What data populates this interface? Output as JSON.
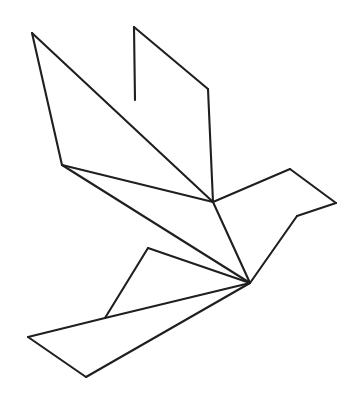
{
  "artwork": {
    "title": "Origami Dove Line Drawing",
    "subject": "origami-style geometric bird in flight",
    "style": "black outline line art on white background",
    "canvas": {
      "width": 363,
      "height": 415
    },
    "background_color": "#ffffff",
    "stroke_color": "#1f1f1f",
    "stroke_width": 2.1,
    "fill": "none",
    "text_content": "",
    "labels": [],
    "vertices": {
      "upper_wing_tip_left": [
        32,
        33
      ],
      "upper_wing_spike_tip": [
        134,
        27
      ],
      "upper_wing_spike_base": [
        135,
        100
      ],
      "upper_wing_right_corner": [
        208,
        89
      ],
      "upper_wing_right_lower": [
        213,
        202
      ],
      "left_shoulder": [
        62,
        165
      ],
      "body_center_junction": [
        213,
        202
      ],
      "head_top": [
        290,
        169
      ],
      "beak_tip": [
        336,
        203
      ],
      "beak_notch": [
        297,
        216
      ],
      "tail_convergence": [
        250,
        283
      ],
      "leg_knee": [
        148,
        248
      ],
      "tail_upper_junction": [
        105,
        318
      ],
      "tail_left_tip": [
        28,
        337
      ],
      "tail_bottom_tip": [
        86,
        377
      ]
    },
    "segments": [
      {
        "name": "left-wing-leading-edge",
        "points": "32,33 213,202"
      },
      {
        "name": "left-wing-outer-edge",
        "points": "32,33 62,165"
      },
      {
        "name": "left-wing-inner-fold",
        "points": "62,165 213,202"
      },
      {
        "name": "spike-vertical-edge",
        "points": "134,27 135,100"
      },
      {
        "name": "spike-slanted-edge",
        "points": "134,27 208,89"
      },
      {
        "name": "right-wing-outer-edge",
        "points": "208,89 213,202"
      },
      {
        "name": "shoulder-to-tail",
        "points": "62,165 250,283"
      },
      {
        "name": "body-center-to-tail",
        "points": "213,202 250,283"
      },
      {
        "name": "head-upper-back",
        "points": "213,202 290,169"
      },
      {
        "name": "head-beak-upper",
        "points": "290,169 336,203"
      },
      {
        "name": "beak-lower",
        "points": "336,203 297,216"
      },
      {
        "name": "breast-to-tail",
        "points": "297,216 250,283"
      },
      {
        "name": "leg-upper",
        "points": "148,248 250,283"
      },
      {
        "name": "leg-lower",
        "points": "148,248 105,318"
      },
      {
        "name": "tail-top-edge",
        "points": "105,318 250,283"
      },
      {
        "name": "tail-left-upper",
        "points": "105,318 28,337"
      },
      {
        "name": "tail-left-lower",
        "points": "28,337 86,377"
      },
      {
        "name": "tail-bottom-to-convergence",
        "points": "86,377 250,283"
      }
    ]
  }
}
